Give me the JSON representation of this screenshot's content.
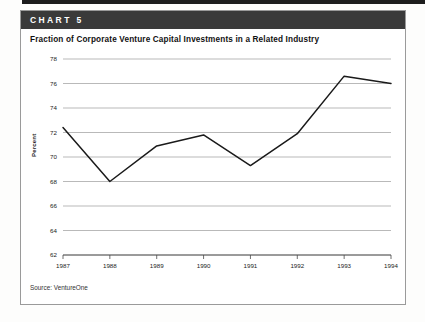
{
  "banner": {
    "label": "CHART 5"
  },
  "title": "Fraction of Corporate Venture Capital Investments in a Related Industry",
  "source": "Source: VentureOne",
  "colors": {
    "banner_bg": "#3a3a3a",
    "banner_text": "#ffffff",
    "line": "#1a1a1a",
    "grid": "#9b9b9b",
    "axis": "#4a4a4a",
    "card_border": "#9a9a9a",
    "page_bg": "#ffffff"
  },
  "chart_data": {
    "type": "line",
    "title": "Fraction of Corporate Venture Capital Investments in a Related Industry",
    "xlabel": "",
    "ylabel": "Percent",
    "categories": [
      "1987",
      "1988",
      "1989",
      "1990",
      "1991",
      "1992",
      "1993",
      "1994"
    ],
    "values": [
      72.4,
      68.0,
      70.9,
      71.8,
      69.3,
      71.9,
      76.6,
      76.0
    ],
    "series": [
      {
        "name": "Fraction of corporate venture capital investments in a related industry",
        "values": [
          72.4,
          68.0,
          70.9,
          71.8,
          69.3,
          71.9,
          76.6,
          76.0
        ]
      }
    ],
    "ylim": [
      62,
      78
    ],
    "yticks": [
      62,
      64,
      66,
      68,
      70,
      72,
      74,
      76,
      78
    ],
    "ytick_labels": [
      "62",
      "64",
      "66",
      "68",
      "70",
      "72",
      "74",
      "76",
      "78"
    ],
    "xtick_labels": [
      "1987",
      "1988",
      "1989",
      "1990",
      "1991",
      "1992",
      "1993",
      "1994"
    ],
    "grid": true,
    "grid_axis": "y",
    "legend": false,
    "legend_position": "none",
    "markers": false,
    "source_note": "Source: VentureOne"
  }
}
